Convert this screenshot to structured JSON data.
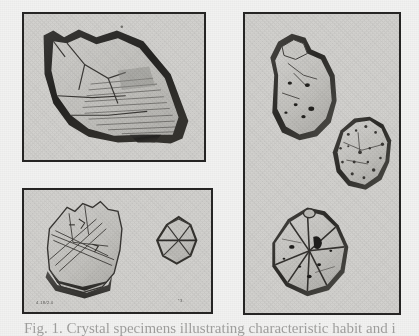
{
  "plate": {
    "background_color": "#f2f2f1",
    "panel_fill_color": "#d3d2cf",
    "panel_border_color": "#262524",
    "ink_color": "#2b2a28",
    "medium": "halftone photographic plate",
    "panel_count": 3
  },
  "panels": [
    {
      "id": "panel-top-left",
      "name": "top-left-panel",
      "position": "upper left",
      "specimen_count": 1,
      "specimens": [
        {
          "name": "elongated-tabular-crystal",
          "description": "large elongated tabular crystal with dark rim and striated cleavage faces"
        }
      ]
    },
    {
      "id": "panel-bottom-left",
      "name": "bottom-left-panel",
      "position": "lower left",
      "specimen_count": 2,
      "specimens": [
        {
          "name": "blocky-striated-crystal",
          "description": "blocky crystal fragment with intersecting striation lines and dark basal shadow"
        },
        {
          "name": "small-lenticular-crystal",
          "description": "small lens / rhomb shaped crystal with horizontal median edge"
        }
      ]
    },
    {
      "id": "panel-right",
      "name": "right-panel",
      "position": "right column",
      "specimen_count": 3,
      "specimens": [
        {
          "name": "upper-rounded-crystal",
          "description": "upper rounded nodular crystal with dark inclusions"
        },
        {
          "name": "middle-granular-crystal",
          "description": "middle granular rough-textured crystal fragment"
        },
        {
          "name": "lower-octahedral-crystal",
          "description": "lower octahedral crystal with pronounced edges and dark inclusions"
        }
      ]
    }
  ],
  "labels": {
    "specimen_a": "4.18/2.0",
    "specimen_b": "*3."
  },
  "caption": {
    "text": "Fig. 1. Crystal specimens illustrating characteristic habit and inclusion"
  }
}
